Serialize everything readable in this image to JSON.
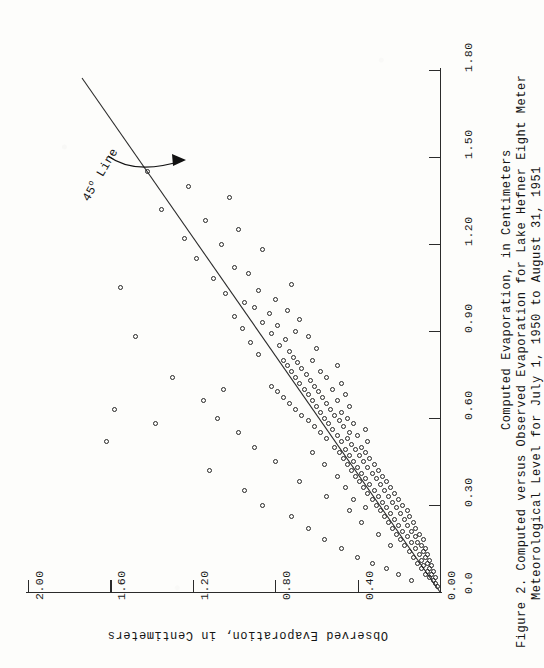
{
  "figure": {
    "caption_lines": [
      "Figure 2. Computed versus Observed Evaporation for Lake Hefner Eight Meter",
      "Meteorological Level for July 1, 1950 to August 31, 1951"
    ],
    "annotation": "45",
    "annotation_degree": "o",
    "annotation_tail": " Line"
  },
  "chart_data": {
    "type": "scatter",
    "xlabel": "Computed Evaporation, in Centimeters",
    "ylabel": "Observed Evaporation, in Centimeters",
    "xlim": [
      0.0,
      1.8
    ],
    "ylim": [
      0.0,
      2.0
    ],
    "xticks": [
      "0.0",
      "0.30",
      "0.60",
      "0.90",
      "1.20",
      "1.50",
      "1.80"
    ],
    "xtickvalues": [
      0.0,
      0.3,
      0.6,
      0.9,
      1.2,
      1.5,
      1.8
    ],
    "yticks": [
      "0.00",
      "0.40",
      "0.80",
      "1.20",
      "1.60",
      "2.00"
    ],
    "ytickvalues": [
      0.0,
      0.4,
      0.8,
      1.2,
      1.6,
      2.0
    ],
    "grid": false,
    "legend": "none",
    "orientation": "rotated-90-ccw",
    "reference_line": {
      "label": "45o Line",
      "type": "identity",
      "from": [
        0.0,
        0.0
      ],
      "to": [
        1.8,
        1.8
      ]
    },
    "marker": "open-circle",
    "points": [
      [
        0.02,
        0.01
      ],
      [
        0.03,
        0.02
      ],
      [
        0.04,
        0.03
      ],
      [
        0.05,
        0.02
      ],
      [
        0.05,
        0.05
      ],
      [
        0.06,
        0.04
      ],
      [
        0.06,
        0.07
      ],
      [
        0.07,
        0.03
      ],
      [
        0.07,
        0.06
      ],
      [
        0.08,
        0.05
      ],
      [
        0.08,
        0.09
      ],
      [
        0.09,
        0.04
      ],
      [
        0.09,
        0.08
      ],
      [
        0.1,
        0.06
      ],
      [
        0.1,
        0.11
      ],
      [
        0.11,
        0.05
      ],
      [
        0.11,
        0.09
      ],
      [
        0.12,
        0.07
      ],
      [
        0.12,
        0.13
      ],
      [
        0.13,
        0.06
      ],
      [
        0.13,
        0.1
      ],
      [
        0.14,
        0.08
      ],
      [
        0.14,
        0.15
      ],
      [
        0.15,
        0.07
      ],
      [
        0.15,
        0.12
      ],
      [
        0.16,
        0.09
      ],
      [
        0.16,
        0.17
      ],
      [
        0.17,
        0.11
      ],
      [
        0.17,
        0.14
      ],
      [
        0.18,
        0.08
      ],
      [
        0.18,
        0.19
      ],
      [
        0.19,
        0.12
      ],
      [
        0.19,
        0.16
      ],
      [
        0.2,
        0.1
      ],
      [
        0.2,
        0.21
      ],
      [
        0.21,
        0.14
      ],
      [
        0.21,
        0.18
      ],
      [
        0.22,
        0.12
      ],
      [
        0.22,
        0.23
      ],
      [
        0.23,
        0.16
      ],
      [
        0.23,
        0.2
      ],
      [
        0.24,
        0.13
      ],
      [
        0.24,
        0.25
      ],
      [
        0.25,
        0.17
      ],
      [
        0.25,
        0.22
      ],
      [
        0.26,
        0.15
      ],
      [
        0.26,
        0.27
      ],
      [
        0.27,
        0.19
      ],
      [
        0.27,
        0.24
      ],
      [
        0.28,
        0.16
      ],
      [
        0.28,
        0.29
      ],
      [
        0.29,
        0.21
      ],
      [
        0.29,
        0.26
      ],
      [
        0.3,
        0.18
      ],
      [
        0.3,
        0.31
      ],
      [
        0.31,
        0.23
      ],
      [
        0.31,
        0.28
      ],
      [
        0.32,
        0.2
      ],
      [
        0.32,
        0.33
      ],
      [
        0.33,
        0.25
      ],
      [
        0.33,
        0.3
      ],
      [
        0.34,
        0.22
      ],
      [
        0.34,
        0.35
      ],
      [
        0.35,
        0.27
      ],
      [
        0.35,
        0.32
      ],
      [
        0.36,
        0.24
      ],
      [
        0.36,
        0.37
      ],
      [
        0.37,
        0.29
      ],
      [
        0.37,
        0.34
      ],
      [
        0.38,
        0.26
      ],
      [
        0.38,
        0.39
      ],
      [
        0.39,
        0.31
      ],
      [
        0.39,
        0.36
      ],
      [
        0.4,
        0.28
      ],
      [
        0.4,
        0.41
      ],
      [
        0.41,
        0.33
      ],
      [
        0.41,
        0.38
      ],
      [
        0.42,
        0.3
      ],
      [
        0.42,
        0.43
      ],
      [
        0.43,
        0.35
      ],
      [
        0.43,
        0.4
      ],
      [
        0.44,
        0.32
      ],
      [
        0.44,
        0.45
      ],
      [
        0.45,
        0.37
      ],
      [
        0.45,
        0.42
      ],
      [
        0.46,
        0.34
      ],
      [
        0.46,
        0.47
      ],
      [
        0.47,
        0.39
      ],
      [
        0.47,
        0.44
      ],
      [
        0.48,
        0.36
      ],
      [
        0.48,
        0.49
      ],
      [
        0.49,
        0.41
      ],
      [
        0.49,
        0.46
      ],
      [
        0.5,
        0.38
      ],
      [
        0.5,
        0.51
      ],
      [
        0.51,
        0.43
      ],
      [
        0.52,
        0.48
      ],
      [
        0.52,
        0.35
      ],
      [
        0.53,
        0.45
      ],
      [
        0.53,
        0.55
      ],
      [
        0.54,
        0.4
      ],
      [
        0.54,
        0.5
      ],
      [
        0.55,
        0.58
      ],
      [
        0.55,
        0.44
      ],
      [
        0.56,
        0.52
      ],
      [
        0.56,
        0.36
      ],
      [
        0.57,
        0.47
      ],
      [
        0.57,
        0.61
      ],
      [
        0.58,
        0.54
      ],
      [
        0.58,
        0.42
      ],
      [
        0.59,
        0.49
      ],
      [
        0.59,
        0.64
      ],
      [
        0.6,
        0.56
      ],
      [
        0.6,
        0.45
      ],
      [
        0.61,
        0.51
      ],
      [
        0.61,
        0.67
      ],
      [
        0.62,
        0.58
      ],
      [
        0.62,
        0.48
      ],
      [
        0.63,
        0.53
      ],
      [
        0.63,
        0.7
      ],
      [
        0.64,
        0.6
      ],
      [
        0.64,
        0.44
      ],
      [
        0.65,
        0.55
      ],
      [
        0.65,
        0.73
      ],
      [
        0.66,
        0.62
      ],
      [
        0.66,
        0.5
      ],
      [
        0.67,
        0.57
      ],
      [
        0.67,
        0.76
      ],
      [
        0.68,
        0.64
      ],
      [
        0.68,
        0.46
      ],
      [
        0.69,
        0.59
      ],
      [
        0.69,
        0.79
      ],
      [
        0.7,
        0.66
      ],
      [
        0.7,
        0.52
      ],
      [
        0.71,
        0.61
      ],
      [
        0.71,
        0.82
      ],
      [
        0.72,
        0.68
      ],
      [
        0.72,
        0.48
      ],
      [
        0.73,
        0.63
      ],
      [
        0.74,
        0.7
      ],
      [
        0.74,
        0.55
      ],
      [
        0.75,
        0.65
      ],
      [
        0.76,
        0.72
      ],
      [
        0.76,
        0.58
      ],
      [
        0.77,
        0.67
      ],
      [
        0.78,
        0.74
      ],
      [
        0.78,
        0.5
      ],
      [
        0.79,
        0.69
      ],
      [
        0.8,
        0.76
      ],
      [
        0.8,
        0.62
      ],
      [
        0.81,
        0.71
      ],
      [
        0.82,
        0.88
      ],
      [
        0.83,
        0.73
      ],
      [
        0.84,
        0.6
      ],
      [
        0.85,
        0.78
      ],
      [
        0.86,
        0.92
      ],
      [
        0.87,
        0.75
      ],
      [
        0.88,
        0.64
      ],
      [
        0.89,
        0.82
      ],
      [
        0.9,
        0.7
      ],
      [
        0.91,
        0.96
      ],
      [
        0.92,
        0.79
      ],
      [
        0.93,
        0.86
      ],
      [
        0.94,
        0.68
      ],
      [
        0.95,
        1.0
      ],
      [
        0.96,
        0.83
      ],
      [
        0.97,
        0.74
      ],
      [
        0.98,
        0.9
      ],
      [
        1.0,
        0.95
      ],
      [
        1.01,
        0.8
      ],
      [
        1.03,
        1.04
      ],
      [
        1.04,
        0.88
      ],
      [
        1.06,
        0.72
      ],
      [
        1.08,
        1.1
      ],
      [
        1.1,
        0.93
      ],
      [
        1.12,
        1.0
      ],
      [
        1.15,
        1.18
      ],
      [
        1.18,
        0.86
      ],
      [
        1.2,
        1.06
      ],
      [
        1.22,
        1.24
      ],
      [
        1.25,
        0.98
      ],
      [
        1.28,
        1.14
      ],
      [
        1.32,
        1.35
      ],
      [
        1.36,
        1.02
      ],
      [
        1.4,
        1.22
      ],
      [
        1.45,
        1.42
      ],
      [
        1.05,
        1.55
      ],
      [
        0.88,
        1.48
      ],
      [
        0.63,
        1.58
      ],
      [
        0.52,
        1.62
      ],
      [
        0.74,
        1.3
      ],
      [
        0.58,
        1.38
      ],
      [
        0.42,
        1.12
      ],
      [
        0.35,
        0.95
      ],
      [
        0.3,
        0.86
      ],
      [
        0.26,
        0.72
      ],
      [
        0.22,
        0.64
      ],
      [
        0.18,
        0.56
      ],
      [
        0.15,
        0.48
      ],
      [
        0.12,
        0.4
      ],
      [
        0.1,
        0.33
      ],
      [
        0.08,
        0.26
      ],
      [
        0.06,
        0.2
      ],
      [
        0.04,
        0.14
      ],
      [
        0.45,
        0.8
      ],
      [
        0.38,
        0.68
      ],
      [
        0.5,
        0.9
      ],
      [
        0.55,
        0.98
      ],
      [
        0.6,
        1.08
      ],
      [
        0.66,
        1.15
      ],
      [
        0.7,
        1.05
      ],
      [
        0.33,
        0.55
      ],
      [
        0.28,
        0.44
      ],
      [
        0.24,
        0.38
      ],
      [
        0.2,
        0.3
      ],
      [
        0.16,
        0.24
      ],
      [
        0.48,
        0.62
      ],
      [
        0.44,
        0.56
      ],
      [
        0.4,
        0.5
      ],
      [
        0.36,
        0.46
      ],
      [
        0.32,
        0.42
      ],
      [
        0.29,
        0.36
      ]
    ]
  }
}
